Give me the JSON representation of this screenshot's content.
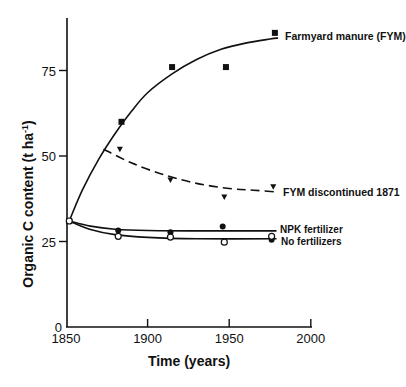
{
  "chart_data": {
    "type": "line",
    "title": "",
    "xlabel": "Time (years)",
    "ylabel": "Organic C content (t ha",
    "ylabel_sup": "-1",
    "ylabel_close": ")",
    "xlim": [
      1850,
      2000
    ],
    "ylim": [
      0,
      90
    ],
    "x_ticks": [
      1850,
      1900,
      1950,
      2000
    ],
    "y_ticks": [
      0,
      25,
      50,
      75
    ],
    "grid": false,
    "legend_position": "inline labels at line ends",
    "series": [
      {
        "name": "Farmyard manure (FYM)",
        "marker": "filled-square",
        "line": "solid",
        "points": [
          [
            1852,
            31
          ],
          [
            1884,
            60
          ],
          [
            1915,
            76
          ],
          [
            1948,
            76
          ],
          [
            1978,
            86
          ]
        ],
        "curve": [
          [
            1852,
            31
          ],
          [
            1860,
            40
          ],
          [
            1870,
            49
          ],
          [
            1880,
            56.5
          ],
          [
            1890,
            63
          ],
          [
            1900,
            68.5
          ],
          [
            1915,
            74
          ],
          [
            1930,
            78.2
          ],
          [
            1945,
            81.2
          ],
          [
            1960,
            83
          ],
          [
            1975,
            84.2
          ],
          [
            1980,
            84.5
          ]
        ]
      },
      {
        "name": "FYM discontinued 1871",
        "marker": "filled-triangle-down",
        "line": "dashed",
        "points": [
          [
            1883,
            52
          ],
          [
            1914,
            43
          ],
          [
            1947,
            38
          ],
          [
            1977,
            41
          ]
        ],
        "curve": [
          [
            1873,
            52
          ],
          [
            1890,
            48
          ],
          [
            1910,
            44.5
          ],
          [
            1930,
            42
          ],
          [
            1950,
            40.5
          ],
          [
            1965,
            40
          ],
          [
            1979,
            39.5
          ]
        ]
      },
      {
        "name": "NPK fertilizer",
        "marker": "filled-circle",
        "line": "solid",
        "points": [
          [
            1882,
            28.2
          ],
          [
            1914,
            27.7
          ],
          [
            1946,
            29.4
          ],
          [
            1976,
            25.5
          ]
        ],
        "curve": [
          [
            1852,
            31
          ],
          [
            1865,
            29.5
          ],
          [
            1880,
            28.6
          ],
          [
            1900,
            28.2
          ],
          [
            1930,
            28.1
          ],
          [
            1979,
            28.1
          ]
        ]
      },
      {
        "name": "No fertilizers",
        "marker": "open-circle",
        "line": "solid",
        "points": [
          [
            1852,
            31
          ],
          [
            1882,
            26.5
          ],
          [
            1914,
            26.3
          ],
          [
            1947,
            24.8
          ],
          [
            1976,
            26.5
          ]
        ],
        "curve": [
          [
            1852,
            31
          ],
          [
            1865,
            28.5
          ],
          [
            1880,
            27
          ],
          [
            1900,
            26.2
          ],
          [
            1930,
            25.8
          ],
          [
            1979,
            25.8
          ]
        ]
      }
    ]
  },
  "labels": {
    "fym": "Farmyard manure (FYM)",
    "fym_disc": "FYM discontinued 1871",
    "npk": "NPK fertilizer",
    "nofert": "No fertilizers"
  },
  "axis": {
    "x_tick_labels": [
      "1850",
      "1900",
      "1950",
      "2000"
    ],
    "y_tick_labels": [
      "0",
      "25",
      "50",
      "75"
    ]
  }
}
